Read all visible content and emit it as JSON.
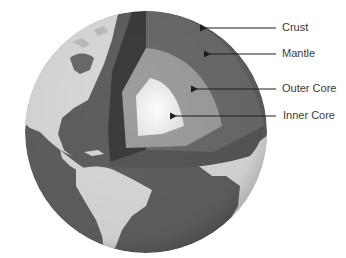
{
  "diagram": {
    "colors": {
      "ocean": "#5f5f5f",
      "land": "#d9d9d9",
      "crust_wall": "#3c3c3c",
      "mantle": "#6a6a6a",
      "outer_core": "#9d9d9d",
      "inner_core": "#f2f2f2",
      "arrow": "#1e1e1e",
      "label_text": "#3a3a3a"
    },
    "layers": [
      {
        "id": "crust",
        "label": "Crust"
      },
      {
        "id": "mantle",
        "label": "Mantle"
      },
      {
        "id": "outer-core",
        "label": "Outer Core"
      },
      {
        "id": "inner-core",
        "label": "Inner Core"
      }
    ]
  }
}
